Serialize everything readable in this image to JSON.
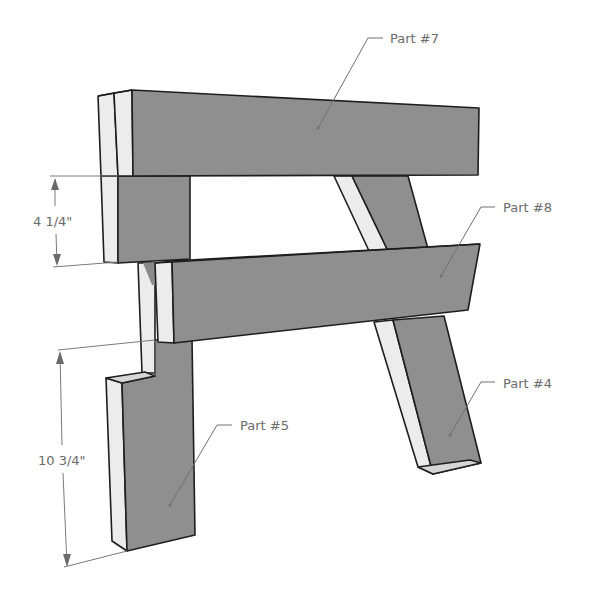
{
  "diagram": {
    "parts": [
      {
        "id": "part7",
        "label": "Part #7"
      },
      {
        "id": "part8",
        "label": "Part #8"
      },
      {
        "id": "part4",
        "label": "Part #4"
      },
      {
        "id": "part5",
        "label": "Part #5"
      }
    ],
    "dimensions": [
      {
        "id": "dim-upper",
        "label": "4 1/4\""
      },
      {
        "id": "dim-lower",
        "label": "10 3/4\""
      }
    ],
    "colors": {
      "front_face": "#8f8f8f",
      "side_face": "#ececec",
      "outline": "#1e1e1e",
      "annotation": "#6a6a6a"
    }
  }
}
